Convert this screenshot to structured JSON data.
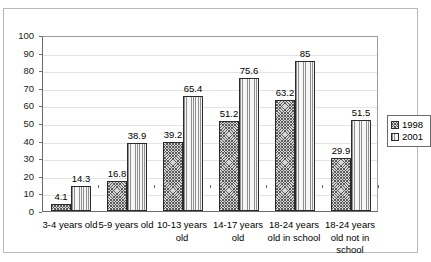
{
  "chart_data": {
    "type": "bar",
    "title": "",
    "subtitle": "",
    "xlabel": "",
    "ylabel": "",
    "ylim": [
      0,
      100
    ],
    "ytick_step": 10,
    "yticks": [
      "100",
      "90",
      "80",
      "70",
      "60",
      "50",
      "40",
      "30",
      "20",
      "10",
      "0"
    ],
    "grid": true,
    "legend_position": "right",
    "categories": [
      "3-4 years old",
      "5-9 years old",
      "10-13 years old",
      "14-17 years old",
      "18-24 years old in school",
      "18-24 years old not in school"
    ],
    "series": [
      {
        "name": "1998",
        "values": [
          4.1,
          16.8,
          39.2,
          51.2,
          63.2,
          29.9
        ],
        "labels": [
          "4.1",
          "16.8",
          "39.2",
          "51.2",
          "63.2",
          "29.9"
        ],
        "pattern": "crosshatch",
        "color": "#d6d6d6"
      },
      {
        "name": "2001",
        "values": [
          14.3,
          38.9,
          65.4,
          75.6,
          85,
          51.5
        ],
        "labels": [
          "14.3",
          "38.9",
          "65.4",
          "75.6",
          "85",
          "51.5"
        ],
        "pattern": "vertical-stripes",
        "color": "#e9e9e9"
      }
    ]
  },
  "legend": {
    "entries": [
      {
        "label": "1998"
      },
      {
        "label": "2001"
      }
    ]
  }
}
